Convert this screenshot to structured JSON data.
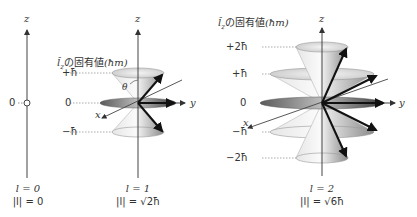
{
  "axes": {
    "z": "z",
    "x": "x",
    "y": "y",
    "theta": "θ"
  },
  "eigen_header": {
    "operator": "l̂",
    "sub": "z",
    "text": "の固有値",
    "unit": "(ħm)"
  },
  "panels": [
    {
      "id": "l0",
      "levels": [
        "0"
      ],
      "l_label": "l = 0",
      "mag_label": "|l| = 0"
    },
    {
      "id": "l1",
      "levels": [
        "+ħ",
        "0",
        "−ħ"
      ],
      "l_label": "l = 1",
      "mag_label": "|l| = √2ħ"
    },
    {
      "id": "l2",
      "levels": [
        "+2ħ",
        "+ħ",
        "0",
        "−ħ",
        "−2ħ"
      ],
      "l_label": "l = 2",
      "mag_label": "|l| = √6ħ"
    }
  ]
}
